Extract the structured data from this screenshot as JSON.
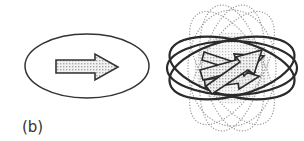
{
  "figure": {
    "panel_label": "(b)",
    "left_diagram": {
      "description": "single ellipse containing a single rightward arrow",
      "ellipse": {
        "cx": 87,
        "cy": 66,
        "rx": 63,
        "ry": 32
      },
      "arrow_fill": "#e2e2e2",
      "stroke": "#333333"
    },
    "right_diagram": {
      "description": "superposition of many rotated ellipses with overlapping arrows",
      "center": {
        "cx": 232,
        "cy": 68
      },
      "solid_ellipse_angles": [
        -14,
        0,
        14
      ],
      "dotted_ellipse_angles": [
        -30,
        -12,
        12,
        30
      ],
      "solid_stroke": "#2a2a2a",
      "dotted_stroke": "#9a9a9a",
      "center_fill": "#c8c8c8"
    }
  }
}
